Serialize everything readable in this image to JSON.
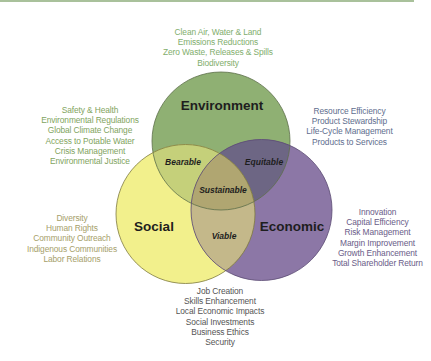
{
  "colors": {
    "top_rule": "#a9c19b",
    "environment": "#8fb073",
    "social": "#f2f08c",
    "economic": "#8c77a6",
    "bearable": "#c5d07a",
    "equitable": "#6d6684",
    "viable": "#c4b88a",
    "sustainable": "#b0a671"
  },
  "circles": {
    "environment": {
      "label": "Environment"
    },
    "social": {
      "label": "Social"
    },
    "economic": {
      "label": "Economic"
    }
  },
  "intersections": {
    "bearable": "Bearable",
    "equitable": "Equitable",
    "viable": "Viable",
    "sustainable": "Sustainable"
  },
  "lists": {
    "environment_top": [
      "Clean Air, Water & Land",
      "Emissions Reductions",
      "Zero Waste, Releases & Spills",
      "Biodiversity"
    ],
    "social_environment": [
      "Safety & Health",
      "Environmental Regulations",
      "Global Climate Change",
      "Access to Potable Water",
      "Crisis Management",
      "Environmental Justice"
    ],
    "environment_economic": [
      "Resource Efficiency",
      "Product Stewardship",
      "Life-Cycle Management",
      "Products to Services"
    ],
    "social": [
      "Diversity",
      "Human Rights",
      "Community Outreach",
      "Indigenous Communities",
      "Labor Relations"
    ],
    "economic": [
      "Innovation",
      "Capital Efficiency",
      "Risk Management",
      "Margin Improvement",
      "Growth Enhancement",
      "Total Shareholder Return"
    ],
    "social_economic": [
      "Job Creation",
      "Skills Enhancement",
      "Local Economic Impacts",
      "Social Investments",
      "Business Ethics",
      "Security"
    ]
  }
}
